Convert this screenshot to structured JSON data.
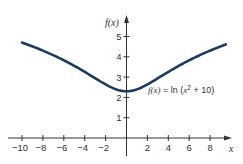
{
  "chart_data": {
    "type": "line",
    "title": "",
    "function": "ln(x^2 + 10)",
    "xlabel": "x",
    "ylabel": "f(x)",
    "xlim": [
      -10,
      9.5
    ],
    "ylim": [
      0,
      5.5
    ],
    "x_ticks": [
      -10,
      -8,
      -6,
      -4,
      -2,
      2,
      4,
      6,
      8
    ],
    "x_tick_labels": [
      "−10",
      "−8",
      "−6",
      "−4",
      "−2",
      "2",
      "4",
      "6",
      "8"
    ],
    "y_ticks": [
      1,
      2,
      3,
      4,
      5
    ],
    "y_tick_labels": [
      "1",
      "2",
      "3",
      "4",
      "5"
    ],
    "grid": false,
    "series": [
      {
        "name": "f(x) = ln(x² + 10)",
        "color": "#1e3a5f",
        "x": [
          -10,
          -9,
          -8,
          -7,
          -6,
          -5,
          -4,
          -3,
          -2,
          -1,
          -0.5,
          0,
          0.5,
          1,
          2,
          3,
          4,
          5,
          6,
          7,
          8,
          9,
          9.5
        ],
        "y": [
          4.7,
          4.51,
          4.3,
          4.08,
          3.83,
          3.56,
          3.26,
          2.94,
          2.64,
          2.4,
          2.33,
          2.3,
          2.33,
          2.4,
          2.64,
          2.94,
          3.26,
          3.56,
          3.83,
          4.08,
          4.3,
          4.51,
          4.61
        ]
      }
    ],
    "annotation": {
      "prefix": "f(x)",
      "equals": " = ln (",
      "var": "x",
      "sup": "2",
      "suffix": " + 10)"
    }
  },
  "colors": {
    "axis": "#333333",
    "curve": "#1e3a5f"
  }
}
